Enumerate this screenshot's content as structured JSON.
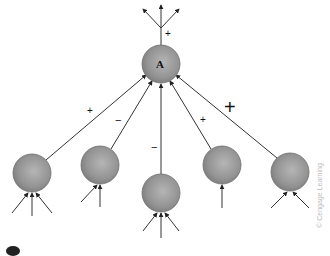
{
  "diagram": {
    "title": "",
    "central_neuron": {
      "label": "A",
      "cx": 161,
      "cy": 64,
      "r": 19
    },
    "output_sign": "+",
    "inputs": [
      {
        "id": "n1",
        "cx": 32,
        "cy": 173,
        "r": 19,
        "sign": "+",
        "sign_size": "small"
      },
      {
        "id": "n2",
        "cx": 100,
        "cy": 165,
        "r": 19,
        "sign": "−",
        "sign_size": "small"
      },
      {
        "id": "n3",
        "cx": 161,
        "cy": 193,
        "r": 19,
        "sign": "−",
        "sign_size": "small"
      },
      {
        "id": "n4",
        "cx": 222,
        "cy": 165,
        "r": 19,
        "sign": "+",
        "sign_size": "small"
      },
      {
        "id": "n5",
        "cx": 290,
        "cy": 172,
        "r": 19,
        "sign": "+",
        "sign_size": "large"
      }
    ],
    "credit": "© Cengage Learning",
    "colors": {
      "neuron": "#8e8e8e",
      "line": "#333333",
      "text": "#111111"
    }
  }
}
